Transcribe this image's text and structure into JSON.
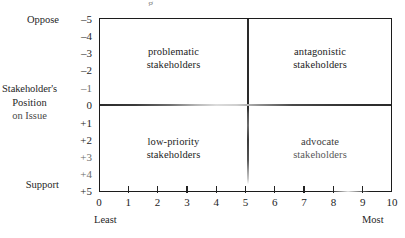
{
  "figure": {
    "title_remnant": "g",
    "y_axis": {
      "label_lines": [
        "Stakeholder's",
        "Position",
        "on Issue"
      ],
      "top_word": "Oppose",
      "bottom_word": "Support",
      "ticks": [
        {
          "value": -5,
          "label": "–5"
        },
        {
          "value": -4,
          "label": "–4"
        },
        {
          "value": -3,
          "label": "–3"
        },
        {
          "value": -2,
          "label": "–2"
        },
        {
          "value": -1,
          "label": "–1"
        },
        {
          "value": 0,
          "label": "0"
        },
        {
          "value": 1,
          "label": "+1"
        },
        {
          "value": 2,
          "label": "+2"
        },
        {
          "value": 3,
          "label": "+3"
        },
        {
          "value": 4,
          "label": "+4"
        },
        {
          "value": 5,
          "label": "+5"
        }
      ]
    },
    "x_axis": {
      "ticks": [
        "0",
        "1",
        "2",
        "3",
        "4",
        "5",
        "6",
        "7",
        "8",
        "9",
        "10"
      ],
      "left_end_label": "Least",
      "right_end_label": "Most"
    },
    "quadrants": [
      {
        "id": "top-left",
        "line1": "problematic",
        "line2": "stakeholders"
      },
      {
        "id": "top-right",
        "line1": "antagonistic",
        "line2": "stakeholders"
      },
      {
        "id": "bottom-left",
        "line1": "low-priority",
        "line2": "stakeholders"
      },
      {
        "id": "bottom-right",
        "line1": "advocate",
        "line2": "stakeholders"
      }
    ]
  },
  "chart_data": {
    "type": "scatter",
    "title": "",
    "xlabel": "",
    "ylabel": "Stakeholder's Position on Issue",
    "xlim": [
      0,
      10
    ],
    "ylim": [
      -5,
      5
    ],
    "grid": false,
    "legend": null,
    "x_tick_labels": [
      "0",
      "1",
      "2",
      "3",
      "4",
      "5",
      "6",
      "7",
      "8",
      "9",
      "10"
    ],
    "y_tick_labels": [
      "–5",
      "–4",
      "–3",
      "–2",
      "–1",
      "0",
      "+1",
      "+2",
      "+3",
      "+4",
      "+5"
    ],
    "x_endpoint_annotations": {
      "left": "Least",
      "right": "Most"
    },
    "y_endpoint_annotations": {
      "top": "Oppose",
      "bottom": "Support"
    },
    "series": [],
    "values": [],
    "annotations": [
      {
        "text": "problematic stakeholders",
        "x_range": [
          0,
          5
        ],
        "y_range": [
          -5,
          0
        ],
        "quadrant": "top-left"
      },
      {
        "text": "antagonistic stakeholders",
        "x_range": [
          5,
          10
        ],
        "y_range": [
          -5,
          0
        ],
        "quadrant": "top-right"
      },
      {
        "text": "low-priority stakeholders",
        "x_range": [
          0,
          5
        ],
        "y_range": [
          0,
          5
        ],
        "quadrant": "bottom-left"
      },
      {
        "text": "advocate stakeholders",
        "x_range": [
          5,
          10
        ],
        "y_range": [
          0,
          5
        ],
        "quadrant": "bottom-right"
      }
    ],
    "dividers": {
      "vertical_x": 5,
      "horizontal_y": 0
    },
    "colors": {
      "frame": "#1c1c1c",
      "text": "#232323",
      "background": "#ffffff"
    }
  }
}
